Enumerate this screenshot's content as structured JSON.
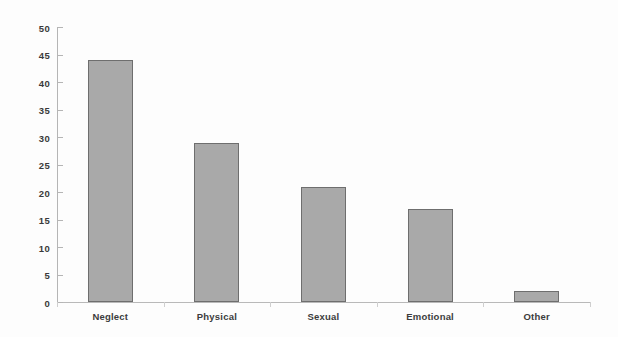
{
  "chart_data": {
    "type": "bar",
    "title": "",
    "subtitle": "",
    "xlabel": "",
    "ylabel": "",
    "categories": [
      "Neglect",
      "Physical",
      "Sexual",
      "Emotional",
      "Other"
    ],
    "values": [
      44,
      29,
      21,
      17,
      2
    ],
    "series": [
      {
        "name": "Count",
        "values": [
          44,
          29,
          21,
          17,
          2
        ]
      }
    ],
    "ylim": [
      0,
      50
    ],
    "y_ticks": [
      0,
      5,
      10,
      15,
      20,
      25,
      30,
      35,
      40,
      45,
      50
    ],
    "y_tick_labels": [
      "0",
      "5",
      "10",
      "15",
      "20",
      "25",
      "30",
      "35",
      "40",
      "45",
      "50"
    ],
    "grid": false,
    "legend": false,
    "legend_position": "none",
    "annotations": [],
    "colors": {
      "bar_fill": "#a9a9a9",
      "bar_border": "#6e6e6e",
      "axis": "#b5b5b5",
      "text": "#3a3a3a",
      "background": "#fdfdfd"
    }
  }
}
